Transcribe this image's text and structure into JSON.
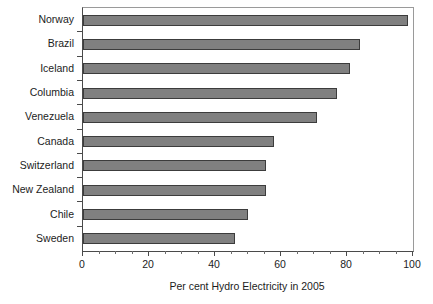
{
  "chart_data": {
    "type": "bar",
    "orientation": "horizontal",
    "title": "",
    "xlabel": "Per cent Hydro Electricity in 2005",
    "ylabel": "",
    "categories": [
      "Norway",
      "Brazil",
      "Iceland",
      "Columbia",
      "Venezuela",
      "Canada",
      "Switzerland",
      "New Zealand",
      "Chile",
      "Sweden"
    ],
    "values": [
      98.5,
      84,
      81,
      77,
      71,
      58,
      55.5,
      55.5,
      50,
      46
    ],
    "xlim": [
      0,
      100
    ],
    "xticks": [
      0,
      20,
      40,
      60,
      80,
      100
    ],
    "xtick_labels": [
      "0",
      "20",
      "40",
      "60",
      "80",
      "100"
    ],
    "minor_tick_step": 5,
    "grid": false,
    "legend": null,
    "bar_color": "#808080",
    "bar_edge_color": "#3c3c3c",
    "axis_color": "#4a4a4a",
    "text_color": "#1c1c1c"
  }
}
